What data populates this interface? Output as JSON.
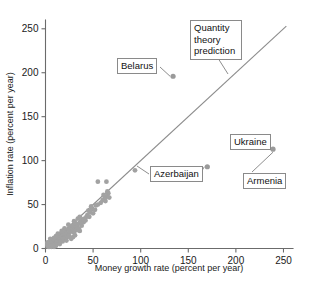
{
  "chart_data": {
    "type": "scatter",
    "title": "",
    "xlabel": "Money growth rate (percent per year)",
    "ylabel": "Inflation rate (percent per year)",
    "xlim": [
      0,
      260
    ],
    "ylim": [
      0,
      260
    ],
    "xticks": [
      0,
      50,
      100,
      150,
      200,
      250
    ],
    "yticks": [
      0,
      50,
      100,
      150,
      200,
      250
    ],
    "xtick_labels": [
      "0",
      "50",
      "100",
      "150",
      "200",
      "250"
    ],
    "ytick_labels": [
      "0",
      "50",
      "100",
      "150",
      "200",
      "250"
    ],
    "grid": false,
    "legend": null,
    "reference_line": {
      "name": "Quantity theory prediction",
      "description": "45-degree line, inflation equals money growth",
      "x": [
        0,
        253
      ],
      "y": [
        0,
        253
      ]
    },
    "series": [
      {
        "name": "Countries",
        "marker": "circle",
        "color": "#9a9a9a",
        "points": [
          {
            "x": 134,
            "y": 196,
            "label": "Belarus"
          },
          {
            "x": 170,
            "y": 93,
            "label": "Azerbaijan"
          },
          {
            "x": 222,
            "y": 119,
            "label": "Ukraine"
          },
          {
            "x": 239,
            "y": 113,
            "label": "Armenia"
          },
          {
            "x": 94,
            "y": 89
          },
          {
            "x": 64,
            "y": 76
          },
          {
            "x": 55,
            "y": 76
          },
          {
            "x": 66,
            "y": 63
          },
          {
            "x": 65,
            "y": 60
          },
          {
            "x": 64,
            "y": 59
          },
          {
            "x": 62,
            "y": 57
          },
          {
            "x": 60,
            "y": 55
          },
          {
            "x": 55,
            "y": 50
          },
          {
            "x": 49,
            "y": 45
          },
          {
            "x": 47,
            "y": 41
          },
          {
            "x": 44,
            "y": 38
          },
          {
            "x": 43,
            "y": 36
          },
          {
            "x": 41,
            "y": 34
          },
          {
            "x": 39,
            "y": 33
          },
          {
            "x": 37,
            "y": 31
          },
          {
            "x": 36,
            "y": 29
          },
          {
            "x": 34,
            "y": 28
          },
          {
            "x": 33,
            "y": 27
          },
          {
            "x": 33,
            "y": 25
          },
          {
            "x": 32,
            "y": 24
          },
          {
            "x": 31,
            "y": 23
          },
          {
            "x": 30,
            "y": 26
          },
          {
            "x": 29,
            "y": 22
          },
          {
            "x": 36,
            "y": 20
          },
          {
            "x": 30,
            "y": 18
          },
          {
            "x": 28,
            "y": 21
          },
          {
            "x": 27,
            "y": 20
          },
          {
            "x": 26,
            "y": 19
          },
          {
            "x": 25,
            "y": 18
          },
          {
            "x": 24,
            "y": 22
          },
          {
            "x": 23,
            "y": 17
          },
          {
            "x": 22,
            "y": 16
          },
          {
            "x": 21,
            "y": 19
          },
          {
            "x": 20,
            "y": 15
          },
          {
            "x": 20,
            "y": 18
          },
          {
            "x": 19,
            "y": 14
          },
          {
            "x": 18,
            "y": 16
          },
          {
            "x": 18,
            "y": 13
          },
          {
            "x": 17,
            "y": 15
          },
          {
            "x": 17,
            "y": 12
          },
          {
            "x": 16,
            "y": 14
          },
          {
            "x": 16,
            "y": 11
          },
          {
            "x": 15,
            "y": 13
          },
          {
            "x": 15,
            "y": 10
          },
          {
            "x": 14,
            "y": 12
          },
          {
            "x": 14,
            "y": 9
          },
          {
            "x": 13,
            "y": 11
          },
          {
            "x": 13,
            "y": 8
          },
          {
            "x": 12,
            "y": 10
          },
          {
            "x": 12,
            "y": 13
          },
          {
            "x": 11,
            "y": 9
          },
          {
            "x": 11,
            "y": 7
          },
          {
            "x": 10,
            "y": 11
          },
          {
            "x": 10,
            "y": 8
          },
          {
            "x": 9,
            "y": 10
          },
          {
            "x": 9,
            "y": 6
          },
          {
            "x": 8,
            "y": 9
          },
          {
            "x": 8,
            "y": 7
          },
          {
            "x": 7,
            "y": 8
          },
          {
            "x": 7,
            "y": 5
          },
          {
            "x": 6,
            "y": 7
          },
          {
            "x": 6,
            "y": 9
          },
          {
            "x": 5,
            "y": 6
          },
          {
            "x": 5,
            "y": 4
          },
          {
            "x": 4,
            "y": 5
          },
          {
            "x": 4,
            "y": 7
          },
          {
            "x": 3,
            "y": 4
          },
          {
            "x": 3,
            "y": 6
          },
          {
            "x": 2,
            "y": 3
          },
          {
            "x": 2,
            "y": 5
          },
          {
            "x": 21,
            "y": 12
          },
          {
            "x": 23,
            "y": 13
          },
          {
            "x": 25,
            "y": 14
          },
          {
            "x": 19,
            "y": 11
          },
          {
            "x": 26,
            "y": 24
          },
          {
            "x": 28,
            "y": 26
          },
          {
            "x": 31,
            "y": 29
          },
          {
            "x": 33,
            "y": 21
          },
          {
            "x": 35,
            "y": 23
          },
          {
            "x": 38,
            "y": 26
          },
          {
            "x": 40,
            "y": 30
          },
          {
            "x": 42,
            "y": 32
          },
          {
            "x": 46,
            "y": 36
          },
          {
            "x": 50,
            "y": 40
          },
          {
            "x": 52,
            "y": 44
          },
          {
            "x": 58,
            "y": 52
          },
          {
            "x": 63,
            "y": 54
          },
          {
            "x": 67,
            "y": 58
          },
          {
            "x": 16,
            "y": 17
          },
          {
            "x": 14,
            "y": 15
          },
          {
            "x": 12,
            "y": 6
          },
          {
            "x": 10,
            "y": 4
          },
          {
            "x": 8,
            "y": 3
          },
          {
            "x": 6,
            "y": 2
          },
          {
            "x": 4,
            "y": 2
          },
          {
            "x": 22,
            "y": 9
          },
          {
            "x": 27,
            "y": 11
          },
          {
            "x": 29,
            "y": 13
          },
          {
            "x": 31,
            "y": 15
          },
          {
            "x": 18,
            "y": 8
          },
          {
            "x": 15,
            "y": 5
          },
          {
            "x": 11,
            "y": 3
          },
          {
            "x": 9,
            "y": 2
          },
          {
            "x": 7,
            "y": 3
          },
          {
            "x": 5,
            "y": 8
          },
          {
            "x": 3,
            "y": 2
          },
          {
            "x": 2,
            "y": 7
          },
          {
            "x": 20,
            "y": 23
          },
          {
            "x": 24,
            "y": 27
          },
          {
            "x": 13,
            "y": 17
          },
          {
            "x": 17,
            "y": 20
          },
          {
            "x": 11,
            "y": 14
          },
          {
            "x": 9,
            "y": 12
          },
          {
            "x": 7,
            "y": 10
          },
          {
            "x": 5,
            "y": 11
          },
          {
            "x": 34,
            "y": 34
          },
          {
            "x": 36,
            "y": 36
          },
          {
            "x": 45,
            "y": 43
          },
          {
            "x": 48,
            "y": 48
          },
          {
            "x": 53,
            "y": 49
          },
          {
            "x": 61,
            "y": 61
          },
          {
            "x": 65,
            "y": 65
          },
          {
            "x": 30,
            "y": 31
          }
        ]
      }
    ],
    "annotations": [
      {
        "name": "Belarus",
        "text": "Belarus",
        "target_x": 134,
        "target_y": 196
      },
      {
        "name": "Quantity theory prediction",
        "text": "Quantity theory prediction",
        "target": "reference-line"
      },
      {
        "name": "Azerbaijan",
        "text": "Azerbaijan",
        "target_x": 170,
        "target_y": 93
      },
      {
        "name": "Ukraine",
        "text": "Ukraine",
        "target_x": 222,
        "target_y": 119
      },
      {
        "name": "Armenia",
        "text": "Armenia",
        "target_x": 239,
        "target_y": 113
      }
    ]
  },
  "callouts": {
    "belarus": "Belarus",
    "quantity_theory_line1": "Quantity",
    "quantity_theory_line2": "theory",
    "quantity_theory_line3": "prediction",
    "azerbaijan": "Azerbaijan",
    "ukraine": "Ukraine",
    "armenia": "Armenia"
  },
  "axes": {
    "x_title": "Money growth rate (percent per year)",
    "y_title": "Inflation rate (percent per year)",
    "x_ticks": [
      "0",
      "50",
      "100",
      "150",
      "200",
      "250"
    ],
    "y_ticks": [
      "0",
      "50",
      "100",
      "150",
      "200",
      "250"
    ]
  },
  "colors": {
    "marker": "#9a9a9a",
    "line": "#8c8c8c",
    "axis": "#6b6b6b",
    "text": "#111111",
    "background": "#ffffff"
  }
}
